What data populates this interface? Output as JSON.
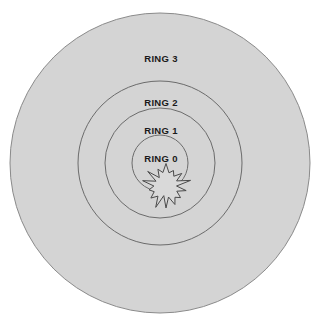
{
  "diagram": {
    "type": "concentric-rings",
    "canvas": {
      "width": 327,
      "height": 325,
      "background": "#ffffff"
    },
    "center": {
      "x": 160,
      "y": 163
    },
    "colors": {
      "ring_fill": "#d4d4d4",
      "ring_stroke": "#6b6b6b",
      "outer_stroke": "#8a8a8a",
      "burst_fill": "#d9d9d9",
      "burst_stroke": "#4a4a4a",
      "label_text": "#1a1a1a",
      "background": "#ffffff"
    },
    "rings": [
      {
        "id": "ring-3",
        "label": "RING 3",
        "radius": 150,
        "label_x": 161,
        "label_y": 59,
        "fill": "#d4d4d4",
        "stroke": "#8a8a8a"
      },
      {
        "id": "ring-2",
        "label": "RING 2",
        "radius": 82,
        "label_x": 161,
        "label_y": 103,
        "fill": "#d4d4d4",
        "stroke": "#6b6b6b"
      },
      {
        "id": "ring-1",
        "label": "RING 1",
        "radius": 55,
        "label_x": 161,
        "label_y": 131,
        "fill": "#d4d4d4",
        "stroke": "#6b6b6b"
      },
      {
        "id": "ring-0",
        "label": "RING 0",
        "radius": 28,
        "label_x": 161,
        "label_y": 159,
        "fill": "#d4d4d4",
        "stroke": "#6b6b6b"
      }
    ],
    "burst": {
      "id": "center-burst",
      "name": "starburst",
      "center_x": 166,
      "center_y": 186,
      "outer_radius": 21,
      "inner_radius": 12,
      "points": 14,
      "fill": "#d9d9d9",
      "stroke": "#4a4a4a"
    }
  }
}
